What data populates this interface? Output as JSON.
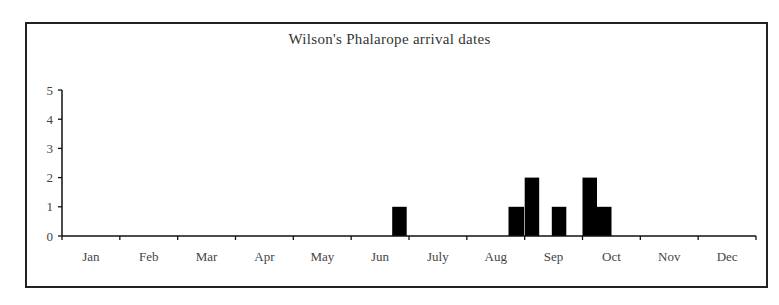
{
  "chart_data": {
    "type": "bar",
    "title": "Wilson's Phalarope arrival dates",
    "xlabel": "",
    "ylabel": "",
    "ylim": [
      0,
      5
    ],
    "yticks": [
      0,
      1,
      2,
      3,
      4,
      5
    ],
    "grid": false,
    "legend": null,
    "months": [
      "Jan",
      "Feb",
      "Mar",
      "Apr",
      "May",
      "Jun",
      "July",
      "Aug",
      "Sep",
      "Oct",
      "Nov",
      "Dec"
    ],
    "bin_unit": "quarter-month (weekly) bins",
    "bars": [
      {
        "period": "late Jun",
        "month_index": 5,
        "start_fraction": 0.71,
        "width_fraction": 0.25,
        "value": 1
      },
      {
        "period": "late Aug",
        "month_index": 7,
        "start_fraction": 0.72,
        "width_fraction": 0.27,
        "value": 1
      },
      {
        "period": "early Sep",
        "month_index": 8,
        "start_fraction": 0.0,
        "width_fraction": 0.25,
        "value": 2
      },
      {
        "period": "mid Sep",
        "month_index": 8,
        "start_fraction": 0.47,
        "width_fraction": 0.25,
        "value": 1
      },
      {
        "period": "early Oct",
        "month_index": 9,
        "start_fraction": 0.0,
        "width_fraction": 0.25,
        "value": 2
      },
      {
        "period": "early-mid Oct",
        "month_index": 9,
        "start_fraction": 0.25,
        "width_fraction": 0.25,
        "value": 1
      }
    ],
    "colors": {
      "bar": "#000000",
      "axis": "#111111",
      "frame": "#222222"
    }
  }
}
